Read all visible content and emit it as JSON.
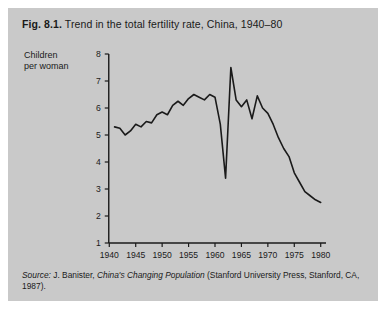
{
  "figure": {
    "number": "Fig. 8.1.",
    "title": "Trend in the total fertility rate, China, 1940–80",
    "source_label": "Source:",
    "source_pre": " J. Banister, ",
    "source_italic": "China's Changing Population",
    "source_post": " (Stanford University Press, Stanford, CA, 1987).",
    "background_color": "#c9c9c9",
    "page_color": "#ffffff",
    "line_color": "#1a1a1a"
  },
  "chart_data": {
    "type": "line",
    "title": "Trend in the total fertility rate, China, 1940–80",
    "xlabel": "",
    "ylabel": "Children per woman",
    "ylabel_line1": "Children",
    "ylabel_line2": "per woman",
    "xlim": [
      1939,
      1981
    ],
    "ylim": [
      1,
      8
    ],
    "grid": false,
    "legend": false,
    "xticks": [
      1940,
      1945,
      1950,
      1955,
      1960,
      1965,
      1970,
      1975,
      1980
    ],
    "yticks": [
      1,
      2,
      3,
      4,
      5,
      6,
      7,
      8
    ],
    "series": [
      {
        "name": "Total fertility rate",
        "x": [
          1941,
          1942,
          1943,
          1944,
          1945,
          1946,
          1947,
          1948,
          1949,
          1950,
          1951,
          1952,
          1953,
          1954,
          1955,
          1956,
          1957,
          1958,
          1959,
          1960,
          1961,
          1962,
          1963,
          1964,
          1965,
          1966,
          1967,
          1968,
          1969,
          1970,
          1971,
          1972,
          1973,
          1974,
          1975,
          1976,
          1977,
          1978,
          1979,
          1980
        ],
        "values": [
          5.3,
          5.25,
          5.0,
          5.15,
          5.4,
          5.3,
          5.5,
          5.45,
          5.75,
          5.85,
          5.75,
          6.1,
          6.25,
          6.1,
          6.35,
          6.5,
          6.4,
          6.3,
          6.5,
          6.4,
          5.4,
          3.4,
          7.5,
          6.3,
          6.05,
          6.3,
          5.6,
          6.45,
          6.0,
          5.8,
          5.4,
          4.9,
          4.5,
          4.2,
          3.6,
          3.25,
          2.9,
          2.75,
          2.6,
          2.5
        ]
      }
    ]
  }
}
